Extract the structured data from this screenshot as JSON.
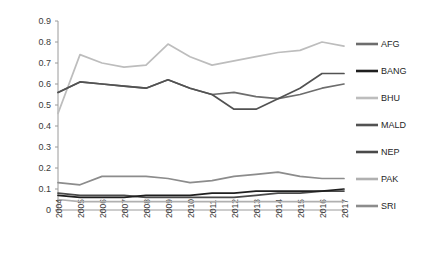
{
  "chart_data": {
    "type": "line",
    "title": "",
    "xlabel": "",
    "ylabel": "",
    "ylim": [
      0,
      0.9
    ],
    "ytick_values": [
      0,
      0.1,
      0.2,
      0.3,
      0.4,
      0.5,
      0.6,
      0.7,
      0.8,
      0.9
    ],
    "ytick_labels": [
      "0",
      "0.1",
      "0.2",
      "0.3",
      "0.4",
      "0.5",
      "0.6",
      "0.7",
      "0.8",
      "0.9"
    ],
    "categories": [
      "2004",
      "2005",
      "2006",
      "2007",
      "2008",
      "2009",
      "2010",
      "2011",
      "2012",
      "2013",
      "2014",
      "2015",
      "2016",
      "2017"
    ],
    "grid": false,
    "legend_position": "right",
    "series": [
      {
        "name": "AFG",
        "color": "#6d6d6d",
        "values": [
          0.56,
          0.61,
          0.6,
          0.59,
          0.58,
          0.62,
          0.58,
          0.55,
          0.56,
          0.54,
          0.53,
          0.55,
          0.58,
          0.6
        ]
      },
      {
        "name": "BANG",
        "color": "#1f1f1f",
        "values": [
          0.07,
          0.06,
          0.06,
          0.06,
          0.07,
          0.07,
          0.07,
          0.08,
          0.08,
          0.09,
          0.09,
          0.09,
          0.09,
          0.1
        ]
      },
      {
        "name": "BHU",
        "color": "#bdbdbd",
        "values": [
          0.46,
          0.74,
          0.7,
          0.68,
          0.69,
          0.79,
          0.73,
          0.69,
          0.71,
          0.73,
          0.75,
          0.76,
          0.8,
          0.78
        ]
      },
      {
        "name": "MALD",
        "color": "#525252",
        "values": [
          0.56,
          0.61,
          0.6,
          0.59,
          0.58,
          0.62,
          0.58,
          0.55,
          0.48,
          0.48,
          0.53,
          0.58,
          0.65,
          0.65
        ]
      },
      {
        "name": "NEP",
        "color": "#4a4a4a",
        "values": [
          0.08,
          0.07,
          0.07,
          0.07,
          0.06,
          0.06,
          0.06,
          0.06,
          0.06,
          0.07,
          0.08,
          0.08,
          0.09,
          0.09
        ]
      },
      {
        "name": "PAK",
        "color": "#b0b0b0",
        "values": [
          0.05,
          0.04,
          0.04,
          0.04,
          0.04,
          0.04,
          0.04,
          0.04,
          0.04,
          0.04,
          0.04,
          0.04,
          0.04,
          0.04
        ]
      },
      {
        "name": "SRI",
        "color": "#8c8c8c",
        "values": [
          0.13,
          0.12,
          0.16,
          0.16,
          0.16,
          0.15,
          0.13,
          0.14,
          0.16,
          0.17,
          0.18,
          0.16,
          0.15,
          0.15
        ]
      }
    ]
  },
  "legend": {
    "items": [
      {
        "label": "AFG",
        "color": "#6d6d6d"
      },
      {
        "label": "BANG",
        "color": "#1f1f1f"
      },
      {
        "label": "BHU",
        "color": "#bdbdbd"
      },
      {
        "label": "MALD",
        "color": "#525252"
      },
      {
        "label": "NEP",
        "color": "#4a4a4a"
      },
      {
        "label": "PAK",
        "color": "#b0b0b0"
      },
      {
        "label": "SRI",
        "color": "#8c8c8c"
      }
    ]
  },
  "axis": {
    "color": "#9a9a9a"
  }
}
